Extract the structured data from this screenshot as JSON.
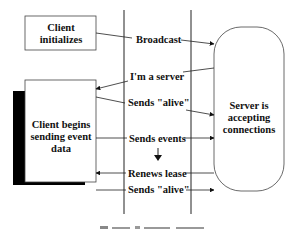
{
  "diagram": {
    "client_init_box": {
      "lines": [
        "Client",
        "initializes"
      ]
    },
    "client_events_box": {
      "lines": [
        "Client begins",
        "sending event",
        "data"
      ]
    },
    "server_box": {
      "lines": [
        "Server is",
        "accepting",
        "connections"
      ]
    },
    "messages": [
      {
        "label": "Broadcast",
        "direction": "to-server"
      },
      {
        "label": "I'm a server",
        "direction": "to-client"
      },
      {
        "label": "Sends \"alive\"",
        "direction": "to-server"
      },
      {
        "label": "Sends events",
        "direction": "to-server"
      },
      {
        "label": "Renews lease",
        "direction": "to-client"
      },
      {
        "label": "Sends \"alive\"",
        "direction": "to-server"
      }
    ],
    "caption": ""
  }
}
